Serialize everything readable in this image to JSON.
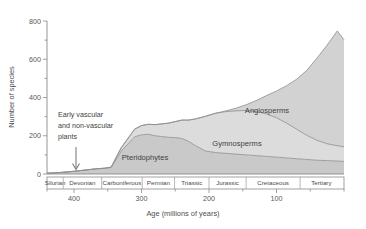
{
  "chart_data": {
    "type": "area",
    "stacked": true,
    "title": "",
    "xlabel": "Age (millions of years)",
    "ylabel": "Number of species",
    "xlim": [
      440,
      0
    ],
    "ylim": [
      0,
      800
    ],
    "x_ticks": [
      400,
      300,
      200,
      100
    ],
    "x_minor_ticks": [
      440,
      350,
      250,
      150,
      50,
      0
    ],
    "y_ticks": [
      0,
      200,
      400,
      600,
      800
    ],
    "y_minor_ticks": [
      100,
      300,
      500,
      700
    ],
    "grid": false,
    "legend": "inline-labels",
    "x_axis_direction": "reversed",
    "x": [
      440,
      420,
      400,
      380,
      365,
      355,
      345,
      330,
      310,
      300,
      290,
      280,
      270,
      260,
      250,
      240,
      230,
      220,
      205,
      190,
      175,
      160,
      145,
      130,
      115,
      100,
      85,
      70,
      55,
      40,
      25,
      10,
      0
    ],
    "series": [
      {
        "name": "Pteridophytes",
        "color": "#c9c9c9",
        "values": [
          4,
          8,
          14,
          22,
          28,
          30,
          34,
          120,
          195,
          205,
          208,
          200,
          196,
          192,
          190,
          186,
          170,
          148,
          120,
          112,
          108,
          104,
          100,
          96,
          92,
          88,
          84,
          80,
          76,
          72,
          70,
          68,
          66
        ]
      },
      {
        "name": "Gymnosperms",
        "color": "#dcdcdc",
        "values": [
          0,
          0,
          0,
          0,
          0,
          0,
          2,
          18,
          40,
          48,
          52,
          58,
          66,
          74,
          84,
          96,
          112,
          140,
          182,
          206,
          218,
          226,
          232,
          230,
          222,
          206,
          182,
          154,
          126,
          104,
          88,
          80,
          76
        ]
      },
      {
        "name": "Angiosperms",
        "color": "#d2d2d2",
        "values": [
          0,
          0,
          0,
          0,
          0,
          0,
          0,
          0,
          0,
          0,
          0,
          0,
          0,
          0,
          0,
          0,
          0,
          0,
          0,
          0,
          4,
          14,
          30,
          58,
          96,
          140,
          196,
          262,
          340,
          430,
          516,
          600,
          560
        ]
      }
    ],
    "annotations": [
      {
        "name": "early-plants-note",
        "text_lines": [
          "Early vascular",
          "and non-vascular",
          "plants"
        ],
        "arrow": "down"
      }
    ],
    "series_labels": [
      {
        "name": "Pteridophytes",
        "text": "Pteridophytes"
      },
      {
        "name": "Gymnosperms",
        "text": "Gymnosperms"
      },
      {
        "name": "Angiosperms",
        "text": "Angiosperms"
      }
    ],
    "period_bands": [
      {
        "label": "Silurian",
        "start": 440,
        "end": 416
      },
      {
        "label": "Devonian",
        "start": 416,
        "end": 359
      },
      {
        "label": "Carboniferous",
        "start": 359,
        "end": 299
      },
      {
        "label": "Permian",
        "start": 299,
        "end": 251
      },
      {
        "label": "Triassic",
        "start": 251,
        "end": 200
      },
      {
        "label": "Jurassic",
        "start": 200,
        "end": 145
      },
      {
        "label": "Cretaceous",
        "start": 145,
        "end": 65
      },
      {
        "label": "Tertiary",
        "start": 65,
        "end": 2
      }
    ]
  }
}
